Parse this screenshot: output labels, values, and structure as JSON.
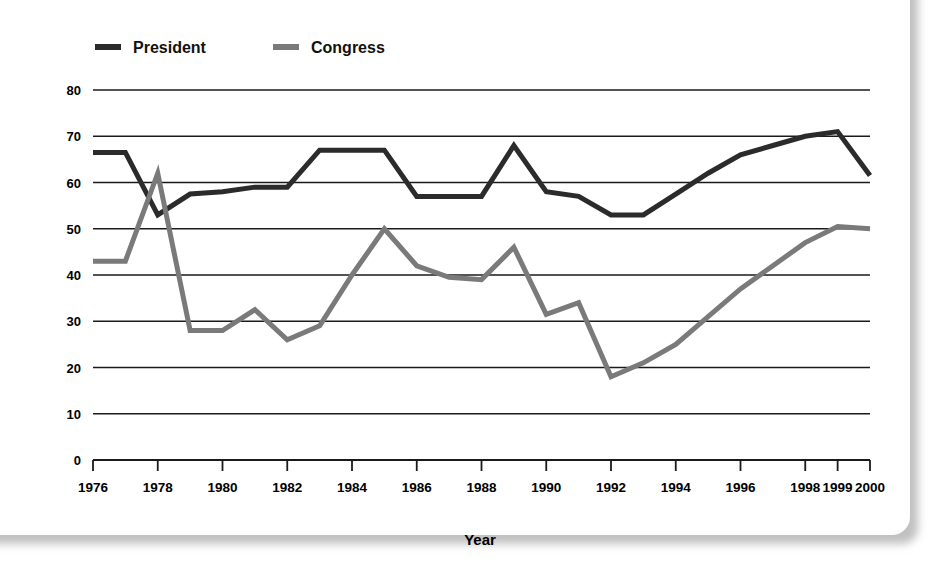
{
  "figure": {
    "background_color": "#ffffff",
    "card_shadow_color": "#8c8c8c"
  },
  "legend": {
    "position": "top-left",
    "entries": [
      {
        "label": "President",
        "color": "#2b2b2b",
        "marker": "line-dash-icon"
      },
      {
        "label": "Congress",
        "color": "#7a7a7a",
        "marker": "line-dash-icon"
      }
    ]
  },
  "chart_data": {
    "type": "line",
    "title": "",
    "xlabel": "Year",
    "ylabel": "Percent Approval",
    "ylim": [
      0,
      80
    ],
    "yticks": [
      0,
      10,
      20,
      30,
      40,
      50,
      60,
      70,
      80
    ],
    "grid": true,
    "xtick_labels": [
      "1976",
      "1978",
      "1980",
      "1982",
      "1984",
      "1986",
      "1988",
      "1990",
      "1992",
      "1994",
      "1996",
      "1998",
      "1999",
      "2000"
    ],
    "x": [
      1976,
      1977,
      1978,
      1979,
      1980,
      1981,
      1982,
      1983,
      1984,
      1985,
      1986,
      1987,
      1988,
      1989,
      1990,
      1991,
      1992,
      1993,
      1994,
      1995,
      1996,
      1997,
      1998,
      1999,
      2000
    ],
    "series": [
      {
        "name": "President",
        "color": "#2b2b2b",
        "line_width": 5,
        "values": [
          66.5,
          66.5,
          53,
          57.5,
          58,
          59,
          59,
          67,
          67,
          67,
          57,
          57,
          57,
          68,
          58,
          57,
          53,
          53,
          57.5,
          62,
          66,
          68,
          70,
          71,
          61.5
        ]
      },
      {
        "name": "Congress",
        "color": "#7a7a7a",
        "line_width": 5,
        "values": [
          43,
          43,
          62,
          28,
          28,
          32.5,
          26,
          29,
          40,
          50,
          42,
          39.5,
          39,
          46,
          31.5,
          34,
          18,
          21,
          25,
          31,
          37,
          42,
          47,
          50.5,
          50
        ]
      }
    ]
  }
}
